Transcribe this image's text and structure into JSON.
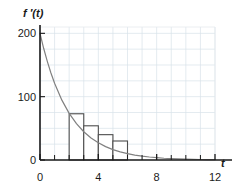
{
  "chart_data": {
    "type": "area",
    "title": "",
    "subtitle": "",
    "xlabel": "t",
    "ylabel": "f ′(t)",
    "xlim": [
      0,
      12
    ],
    "ylim": [
      0,
      210
    ],
    "grid": true,
    "grid_x_step": 1,
    "grid_y_step": 25,
    "legend": "none",
    "x_ticks": [
      0,
      4,
      8,
      12
    ],
    "x_tick_labels": [
      "0",
      "4",
      "8",
      "12"
    ],
    "x_minor_ticks": [
      1,
      2,
      3,
      5,
      6,
      7,
      9,
      10,
      11
    ],
    "y_ticks": [
      0,
      100,
      200
    ],
    "y_tick_labels": [
      "0",
      "100",
      "200"
    ],
    "curve": {
      "name": "f ′(t)",
      "expression": "200 e^(-0.5 t)",
      "color": "#808080",
      "x": [
        0,
        0.25,
        0.5,
        0.75,
        1,
        1.5,
        2,
        2.5,
        3,
        3.5,
        4,
        4.5,
        5,
        5.5,
        6,
        6.5,
        7,
        7.5,
        8,
        8.5,
        9,
        9.5,
        10,
        10.5,
        11,
        11.5,
        12
      ],
      "y": [
        200,
        176.4,
        155.8,
        137.4,
        121.3,
        94.5,
        73.6,
        57.3,
        44.6,
        34.8,
        27.1,
        21.1,
        16.4,
        12.8,
        10.0,
        7.8,
        6.0,
        4.7,
        3.7,
        2.8,
        2.2,
        1.7,
        1.3,
        1.0,
        0.8,
        0.6,
        0.5
      ]
    },
    "rectangles": {
      "name": "left-endpoint rectangles",
      "edge_color": "#4d4d4d",
      "fill_color": "#ffffff",
      "width": 1,
      "x_left": [
        2,
        3,
        4,
        5
      ],
      "x_right": [
        3,
        4,
        5,
        6
      ],
      "heights": [
        73,
        54,
        40,
        30
      ]
    }
  }
}
